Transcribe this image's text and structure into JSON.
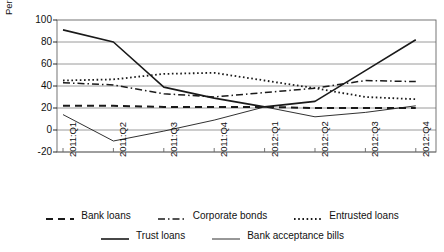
{
  "chart_data": {
    "type": "line",
    "title": "",
    "xlabel": "",
    "ylabel": "Per cent of growth rate",
    "categories": [
      "2011:Q1",
      "2011:Q2",
      "2011:Q3",
      "2011:Q4",
      "2012:Q1",
      "2012:Q2",
      "2012:Q3",
      "2012:Q4"
    ],
    "ylim": [
      -20,
      100
    ],
    "yticks": [
      -20,
      0,
      20,
      40,
      60,
      80,
      100
    ],
    "grid": true,
    "legend_position": "bottom",
    "series": [
      {
        "name": "Bank loans",
        "style": "dashed",
        "values": [
          22,
          22,
          21,
          21,
          21,
          20,
          20,
          20
        ]
      },
      {
        "name": "Corporate bonds",
        "style": "dash-dot",
        "values": [
          43,
          41,
          33,
          30,
          34,
          38,
          45,
          44
        ]
      },
      {
        "name": "Entrusted loans",
        "style": "dotted",
        "values": [
          45,
          46,
          51,
          52,
          45,
          38,
          30,
          28
        ]
      },
      {
        "name": "Trust loans",
        "style": "solid-bold",
        "values": [
          91,
          80,
          39,
          29,
          21,
          26,
          54,
          82
        ]
      },
      {
        "name": "Bank acceptance bills",
        "style": "solid-thin",
        "values": [
          14,
          -10,
          -1,
          9,
          21,
          12,
          16,
          22
        ]
      }
    ]
  },
  "axis": {
    "y_title": "Per cent of growth rate",
    "y_ticks": [
      "100",
      "80",
      "60",
      "40",
      "20",
      "0",
      "-20"
    ],
    "x_ticks": [
      "2011:Q1",
      "2011:Q2",
      "2011:Q3",
      "2011:Q4",
      "2012:Q1",
      "2012:Q2",
      "2012:Q3",
      "2012:Q4"
    ]
  },
  "legend": {
    "row1": [
      {
        "label": "Bank loans",
        "style": "dashed"
      },
      {
        "label": "Corporate bonds",
        "style": "dash-dot"
      },
      {
        "label": "Entrusted loans",
        "style": "dotted"
      }
    ],
    "row2": [
      {
        "label": "Trust loans",
        "style": "solid-bold"
      },
      {
        "label": "Bank acceptance bills",
        "style": "solid-thin"
      }
    ]
  },
  "colors": {
    "line": "#1a1a1a",
    "grid": "#808080",
    "frame": "#666666",
    "background": "#ffffff"
  }
}
